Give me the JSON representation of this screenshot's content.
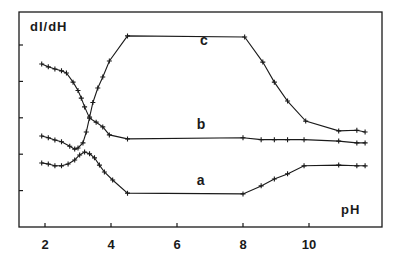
{
  "chart_data": {
    "type": "line",
    "title": "",
    "xlabel": "pH",
    "ylabel": "dI/dH",
    "xlim": [
      1.2,
      12.4
    ],
    "ylim": [
      0,
      6.0
    ],
    "x_ticks": [
      2,
      4,
      6,
      8,
      10
    ],
    "x_tick_labels": [
      "2",
      "4",
      "6",
      "8",
      "10"
    ],
    "y_ticks": [
      1,
      2,
      3,
      4,
      5
    ],
    "y_tick_labels": [
      "",
      "",
      "",
      "",
      ""
    ],
    "grid": false,
    "legend": "inline labels",
    "series": [
      {
        "name": "a",
        "label_pos": [
          6.6,
          1.15
        ],
        "points": [
          [
            1.9,
            1.76
          ],
          [
            2.1,
            1.73
          ],
          [
            2.3,
            1.68
          ],
          [
            2.5,
            1.68
          ],
          [
            2.7,
            1.73
          ],
          [
            2.9,
            1.84
          ],
          [
            3.05,
            1.98
          ],
          [
            3.2,
            2.06
          ],
          [
            3.35,
            2.01
          ],
          [
            3.5,
            1.9
          ],
          [
            3.65,
            1.7
          ],
          [
            3.8,
            1.51
          ],
          [
            4.05,
            1.29
          ],
          [
            4.5,
            0.93
          ],
          [
            8.0,
            0.91
          ],
          [
            8.55,
            1.13
          ],
          [
            8.95,
            1.32
          ],
          [
            9.35,
            1.46
          ],
          [
            9.85,
            1.68
          ],
          [
            10.9,
            1.7
          ],
          [
            11.45,
            1.68
          ],
          [
            11.7,
            1.68
          ]
        ]
      },
      {
        "name": "b",
        "label_pos": [
          6.6,
          2.7
        ],
        "points": [
          [
            1.9,
            4.48
          ],
          [
            2.1,
            4.4
          ],
          [
            2.3,
            4.34
          ],
          [
            2.5,
            4.29
          ],
          [
            2.65,
            4.23
          ],
          [
            2.85,
            3.98
          ],
          [
            3.0,
            3.75
          ],
          [
            3.1,
            3.54
          ],
          [
            3.2,
            3.3
          ],
          [
            3.35,
            2.99
          ],
          [
            3.55,
            2.88
          ],
          [
            3.75,
            2.75
          ],
          [
            3.95,
            2.53
          ],
          [
            4.5,
            2.42
          ],
          [
            8.0,
            2.45
          ],
          [
            8.55,
            2.4
          ],
          [
            8.95,
            2.4
          ],
          [
            9.35,
            2.4
          ],
          [
            9.85,
            2.4
          ],
          [
            10.9,
            2.36
          ],
          [
            11.45,
            2.31
          ],
          [
            11.7,
            2.31
          ]
        ]
      },
      {
        "name": "c",
        "label_pos": [
          6.7,
          5.0
        ],
        "points": [
          [
            1.9,
            2.5
          ],
          [
            2.1,
            2.45
          ],
          [
            2.3,
            2.39
          ],
          [
            2.5,
            2.34
          ],
          [
            2.75,
            2.22
          ],
          [
            2.9,
            2.14
          ],
          [
            3.0,
            2.17
          ],
          [
            3.15,
            2.31
          ],
          [
            3.25,
            2.61
          ],
          [
            3.35,
            3.02
          ],
          [
            3.45,
            3.42
          ],
          [
            3.6,
            3.82
          ],
          [
            3.75,
            4.12
          ],
          [
            3.95,
            4.56
          ],
          [
            4.5,
            5.25
          ],
          [
            8.05,
            5.22
          ],
          [
            8.6,
            4.53
          ],
          [
            8.95,
            3.98
          ],
          [
            9.35,
            3.46
          ],
          [
            9.9,
            2.91
          ],
          [
            10.9,
            2.64
          ],
          [
            11.45,
            2.66
          ],
          [
            11.7,
            2.61
          ]
        ]
      }
    ],
    "marker": "plus",
    "line_color": "#1a1a1a"
  },
  "labels": {
    "ylabel": "dI/dH",
    "xlabel": "pH",
    "a": "a",
    "b": "b",
    "c": "c"
  }
}
